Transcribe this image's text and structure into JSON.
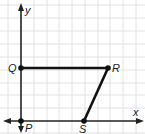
{
  "diagram": {
    "type": "coordinate-plane-figure",
    "axes": {
      "x_label": "x",
      "y_label": "y"
    },
    "grid": {
      "columns": 10,
      "rows": 10,
      "unit_px": 12.8
    },
    "points": [
      {
        "name": "P",
        "x": 0,
        "y": 0
      },
      {
        "name": "Q",
        "x": 0,
        "y": 4
      },
      {
        "name": "R",
        "x": 7,
        "y": 4
      },
      {
        "name": "S",
        "x": 5,
        "y": 0
      }
    ],
    "segments": [
      [
        "Q",
        "R"
      ],
      [
        "R",
        "S"
      ]
    ],
    "colors": {
      "grid": "#e2e2e2",
      "axis": "#222222",
      "figure": "#111111"
    }
  }
}
